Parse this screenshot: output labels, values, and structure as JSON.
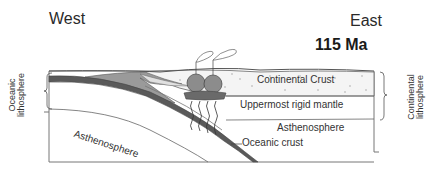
{
  "header": {
    "west_label": "West",
    "east_label": "East",
    "age_label": "115 Ma"
  },
  "labels": {
    "continental_crust": "Continental Crust",
    "uppermost_rigid_mantle": "Uppermost rigid mantle",
    "asthenosphere_right": "Asthenosphere",
    "asthenosphere_left": "Asthenosphere",
    "oceanic_crust": "Oceanic crust",
    "oceanic_lithosphere_line1": "Oceanic",
    "oceanic_lithosphere_line2": "lithosphere",
    "continental_lithosphere_line1": "Continental",
    "continental_lithosphere_line2": "lithosphere"
  },
  "colors": {
    "line": "#555555",
    "oceanic_crust": "#5a5a5a",
    "accretionary_wedge": "#9a9a9a",
    "magma_body": "#8c8c8c",
    "crust_stipple": "#b0b0b0"
  }
}
